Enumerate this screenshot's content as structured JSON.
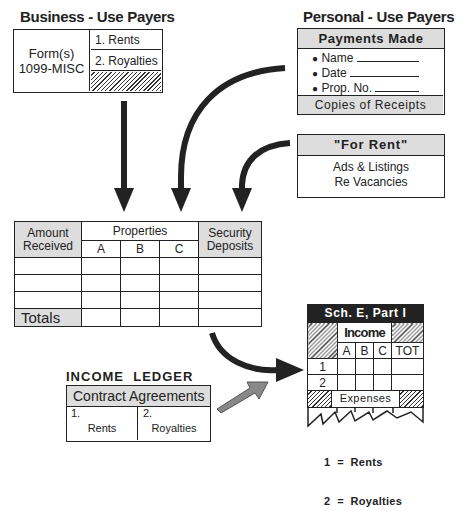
{
  "business_payers": {
    "title": "Business - Use Payers",
    "form_label_1": "Form(s)",
    "form_label_2": "1099-MISC",
    "items": [
      "1. Rents",
      "2. Royalties"
    ]
  },
  "personal_payers": {
    "title": "Personal - Use Payers",
    "header": "Payments Made",
    "fields": [
      "Name",
      "Date",
      "Prop. No."
    ],
    "footer": "Copies of Receipts"
  },
  "for_rent": {
    "header": "\"For Rent\"",
    "line1": "Ads & Listings",
    "line2": "Re Vacancies"
  },
  "ledger": {
    "col_amount_1": "Amount",
    "col_amount_2": "Received",
    "col_properties": "Properties",
    "sub_cols": [
      "A",
      "B",
      "C"
    ],
    "col_security_1": "Security",
    "col_security_2": "Deposits",
    "totals": "Totals",
    "caption_1": "INCOME  LEDGER",
    "caption_2": "(Posted  Monthly)"
  },
  "contract": {
    "title": "Contract Agreements",
    "items": [
      {
        "num": "1.",
        "label": "Rents"
      },
      {
        "num": "2.",
        "label": "Royalties"
      }
    ]
  },
  "schedule_e": {
    "header": "Sch. E, Part I",
    "income": "Income",
    "cols": [
      "A",
      "B",
      "C",
      "TOT"
    ],
    "rows": [
      "1",
      "2"
    ],
    "expenses": "Expenses",
    "legend": [
      "1  =  Rents",
      "2  =  Royalties"
    ]
  }
}
